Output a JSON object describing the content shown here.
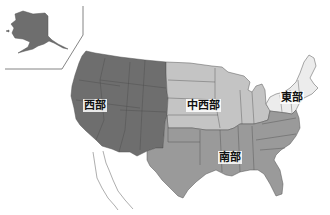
{
  "map": {
    "title": "United States regions",
    "regions": [
      {
        "id": "west",
        "label": "西部",
        "color": "#6e6e6e"
      },
      {
        "id": "midwest",
        "label": "中西部",
        "color": "#c4c4c4"
      },
      {
        "id": "east",
        "label": "東部",
        "color": "#ececec"
      },
      {
        "id": "south",
        "label": "南部",
        "color": "#9a9a9a"
      }
    ],
    "inset": {
      "name": "Alaska",
      "region": "west"
    },
    "border_color": "#555555",
    "background": "#ffffff"
  }
}
